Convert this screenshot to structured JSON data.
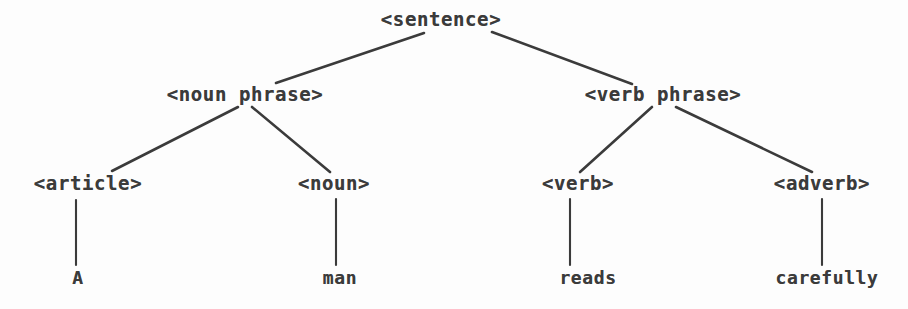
{
  "figure": {
    "background_color": "#fdfdfd",
    "ink_color": "#3b3b3b",
    "width": 908,
    "height": 309
  },
  "levels": {
    "root_y": 22,
    "phrase_y": 97,
    "category_y": 185,
    "word_y": 279
  },
  "nodes": {
    "root": {
      "label": "<sentence>",
      "x": 441,
      "y": 22
    },
    "noun_phrase": {
      "label": "<noun phrase>",
      "x": 245,
      "y": 97
    },
    "verb_phrase": {
      "label": "<verb phrase>",
      "x": 663,
      "y": 97
    },
    "article": {
      "label": "<article>",
      "x": 88,
      "y": 185
    },
    "noun": {
      "label": "<noun>",
      "x": 334,
      "y": 185
    },
    "verb": {
      "label": "<verb>",
      "x": 578,
      "y": 185
    },
    "adverb": {
      "label": "<adverb>",
      "x": 822,
      "y": 185
    }
  },
  "leaves": {
    "article_word": {
      "label": "A",
      "x": 78,
      "y": 279
    },
    "noun_word": {
      "label": "man",
      "x": 340,
      "y": 279
    },
    "verb_word": {
      "label": "reads",
      "x": 588,
      "y": 279
    },
    "adverb_word": {
      "label": "carefully",
      "x": 827,
      "y": 279
    }
  },
  "edges": [
    {
      "name": "edge-sentence-to-noun-phrase",
      "x1": 424,
      "y1": 33,
      "x2": 276,
      "y2": 83
    },
    {
      "name": "edge-sentence-to-verb-phrase",
      "x1": 492,
      "y1": 32,
      "x2": 632,
      "y2": 84
    },
    {
      "name": "edge-noun-phrase-to-article",
      "x1": 238,
      "y1": 107,
      "x2": 112,
      "y2": 171
    },
    {
      "name": "edge-noun-phrase-to-noun",
      "x1": 252,
      "y1": 107,
      "x2": 330,
      "y2": 172
    },
    {
      "name": "edge-verb-phrase-to-verb",
      "x1": 652,
      "y1": 107,
      "x2": 580,
      "y2": 172
    },
    {
      "name": "edge-verb-phrase-to-adverb",
      "x1": 676,
      "y1": 107,
      "x2": 812,
      "y2": 172
    },
    {
      "name": "edge-article-to-word",
      "x1": 76,
      "y1": 200,
      "x2": 76,
      "y2": 265
    },
    {
      "name": "edge-noun-to-word",
      "x1": 336,
      "y1": 199,
      "x2": 336,
      "y2": 265
    },
    {
      "name": "edge-verb-to-word",
      "x1": 570,
      "y1": 199,
      "x2": 570,
      "y2": 265
    },
    {
      "name": "edge-adverb-to-word",
      "x1": 822,
      "y1": 199,
      "x2": 822,
      "y2": 265
    }
  ]
}
